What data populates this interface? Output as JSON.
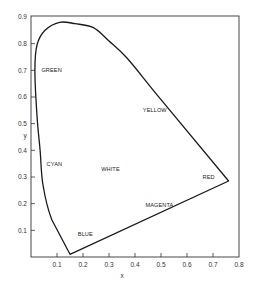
{
  "chart_data": {
    "type": "line",
    "title": "",
    "xlabel": "x",
    "ylabel": "y",
    "xlim": [
      0,
      0.8
    ],
    "ylim": [
      0,
      0.9
    ],
    "grid": false,
    "legend": null,
    "x_ticks": [
      "0.1",
      "0.2",
      "0.3",
      "0.4",
      "0.5",
      "0.6",
      "0.7",
      "0.8"
    ],
    "y_ticks": [
      "0.1",
      "0.2",
      "0.3",
      "0.4",
      "0.5",
      "0.6",
      "0.7",
      "0.8",
      "0.9"
    ],
    "series": [
      {
        "name": "spectral locus",
        "closed": true,
        "points": [
          [
            0.15,
            0.01
          ],
          [
            0.08,
            0.14
          ],
          [
            0.046,
            0.27
          ],
          [
            0.035,
            0.4
          ],
          [
            0.023,
            0.53
          ],
          [
            0.015,
            0.7
          ],
          [
            0.023,
            0.795
          ],
          [
            0.054,
            0.85
          ],
          [
            0.11,
            0.88
          ],
          [
            0.17,
            0.875
          ],
          [
            0.24,
            0.86
          ],
          [
            0.3,
            0.81
          ],
          [
            0.37,
            0.745
          ],
          [
            0.5,
            0.59
          ],
          [
            0.76,
            0.285
          ]
        ]
      }
    ],
    "annotations": [
      {
        "text": "GREEN",
        "x": 0.04,
        "y": 0.7
      },
      {
        "text": "YELLOW",
        "x": 0.43,
        "y": 0.55
      },
      {
        "text": "CYAN",
        "x": 0.06,
        "y": 0.35
      },
      {
        "text": "WHITE",
        "x": 0.27,
        "y": 0.33
      },
      {
        "text": "RED",
        "x": 0.66,
        "y": 0.3
      },
      {
        "text": "MAGENTA",
        "x": 0.44,
        "y": 0.195
      },
      {
        "text": "BLUE",
        "x": 0.18,
        "y": 0.085
      }
    ],
    "line_color": "#1a1a1a",
    "axis_color": "#333333"
  }
}
